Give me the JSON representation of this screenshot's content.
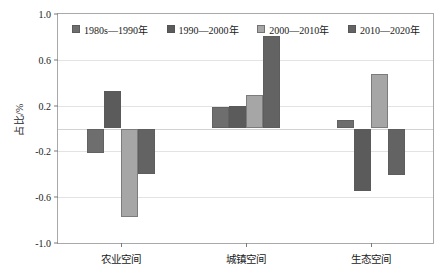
{
  "chart_data": {
    "type": "bar",
    "title": "",
    "subtitle": "",
    "xlabel": "",
    "ylabel": "占比/%",
    "ylim": [
      -1.0,
      1.0
    ],
    "yticks": [
      "1.0",
      "0.6",
      "0.2",
      "-0.2",
      "-0.6",
      "-1.0"
    ],
    "ytick_values": [
      1.0,
      0.6,
      0.2,
      -0.2,
      -0.6,
      -1.0
    ],
    "grid": true,
    "legend_position": "top-inside",
    "categories": [
      "农业空间",
      "城镇空间",
      "生态空间"
    ],
    "series": [
      {
        "name": "1980s—1990年",
        "color": "#6e6e6e",
        "values": [
          -0.21,
          0.19,
          0.07
        ]
      },
      {
        "name": "1990—2000年",
        "color": "#5b5b5b",
        "values": [
          0.33,
          0.2,
          -0.55
        ]
      },
      {
        "name": "2000—2010年",
        "color": "#a6a6a6",
        "values": [
          -0.77,
          0.29,
          0.48
        ]
      },
      {
        "name": "2010—2020年",
        "color": "#636363",
        "values": [
          -0.4,
          0.81,
          -0.41
        ]
      }
    ]
  },
  "legend": {
    "entries": [
      {
        "label": "1980s—1990年"
      },
      {
        "label": "1990—2000年"
      },
      {
        "label": "2000—2010年"
      },
      {
        "label": "2010—2020年"
      }
    ]
  },
  "axes": {
    "y_title": "占比/%",
    "y_tick_labels": [
      "1.0",
      "0.6",
      "0.2",
      "-0.2",
      "-0.6",
      "-1.0"
    ],
    "x_tick_labels": [
      "农业空间",
      "城镇空间",
      "生态空间"
    ]
  },
  "colors": {
    "series_1": "#6e6e6e",
    "series_2": "#5b5b5b",
    "series_3": "#a6a6a6",
    "series_4": "#636363",
    "frame": "#a9a9a9",
    "grid": "#e3e3e3",
    "background": "#ffffff"
  }
}
